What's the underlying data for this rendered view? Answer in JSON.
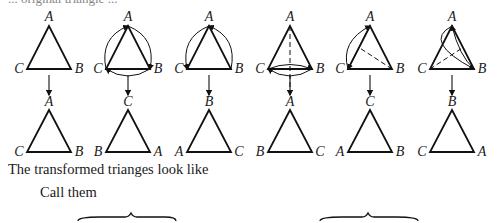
{
  "figure": {
    "top_cut_text": "... original triangle ...",
    "columns": [
      {
        "x": 49,
        "top": {
          "apex": "A",
          "left": "C",
          "right": "B"
        },
        "arrows": [],
        "dashed": [],
        "bottom": {
          "apex": "A",
          "left": "C",
          "right": "B"
        }
      },
      {
        "x": 128,
        "top": {
          "apex": "A",
          "left": "C",
          "right": "B"
        },
        "arrows": [
          "A->B",
          "B->C",
          "C->A"
        ],
        "dashed": [],
        "bottom": {
          "apex": "C",
          "left": "B",
          "right": "A"
        }
      },
      {
        "x": 209,
        "top": {
          "apex": "A",
          "left": "C",
          "right": "B"
        },
        "arrows": [
          "A->C",
          "B->A"
        ],
        "dashed": [],
        "bottom": {
          "apex": "B",
          "left": "A",
          "right": "C"
        }
      },
      {
        "x": 290,
        "top": {
          "apex": "A",
          "left": "C",
          "right": "B"
        },
        "arrows": [
          "C->B",
          "B->C"
        ],
        "dashed": [
          "A-axis"
        ],
        "bottom": {
          "apex": "A",
          "left": "B",
          "right": "C"
        }
      },
      {
        "x": 370,
        "top": {
          "apex": "A",
          "left": "C",
          "right": "B"
        },
        "arrows": [
          "C->A",
          "A->C"
        ],
        "dashed": [
          "B-axis"
        ],
        "bottom": {
          "apex": "C",
          "left": "A",
          "right": "B"
        }
      },
      {
        "x": 452,
        "top": {
          "apex": "A",
          "left": "C",
          "right": "B"
        },
        "arrows": [
          "A->B",
          "B->A"
        ],
        "dashed": [
          "C-axis"
        ],
        "bottom": {
          "apex": "B",
          "left": "C",
          "right": "A"
        }
      }
    ]
  },
  "text": {
    "line1": "The transformed trianges look like",
    "line2": "Call them",
    "names": [
      "I",
      "J",
      "K",
      "L",
      "M",
      "N"
    ],
    "dots": ". . .",
    "sep_dots": ". . . . . . .",
    "sep_commas": ", , , , , , ,"
  }
}
